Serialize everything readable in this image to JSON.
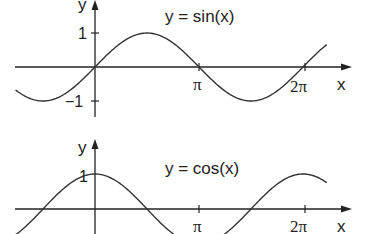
{
  "chart_data": [
    {
      "type": "line",
      "title": "y = sin(x)",
      "xlabel": "x",
      "ylabel": "y",
      "x_ticks": [
        "π",
        "2π"
      ],
      "y_ticks": [
        "1",
        "−1"
      ],
      "x_range": [
        -2.4,
        7.0
      ],
      "ylim": [
        -1,
        1
      ],
      "series": [
        {
          "name": "sin(x)",
          "function": "sin",
          "x": [
            -2.4,
            -1.571,
            0,
            1.571,
            3.142,
            4.712,
            6.283,
            7.0
          ],
          "y": [
            -0.68,
            -1,
            0,
            1,
            0,
            -1,
            0,
            0.66
          ]
        }
      ]
    },
    {
      "type": "line",
      "title": "y = cos(x)",
      "xlabel": "x",
      "ylabel": "y",
      "x_ticks": [
        "π",
        "2π"
      ],
      "y_ticks": [
        "1"
      ],
      "x_range": [
        -2.4,
        7.0
      ],
      "ylim": [
        -1,
        1
      ],
      "series": [
        {
          "name": "cos(x)",
          "function": "cos",
          "x": [
            -2.4,
            -1.571,
            0,
            1.571,
            3.142,
            4.712,
            6.283,
            7.0
          ],
          "y": [
            -0.74,
            0,
            1,
            0,
            -1,
            0,
            1,
            0.75
          ]
        }
      ]
    }
  ],
  "labels": {
    "sin_title": "y = sin(x)",
    "cos_title": "y = cos(x)",
    "y": "y",
    "x": "x",
    "one": "1",
    "minus_one": "−1",
    "pi": "π",
    "two_pi": "2π"
  }
}
